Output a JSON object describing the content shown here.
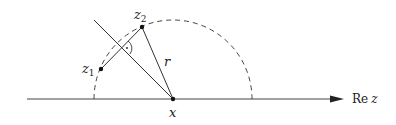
{
  "diagram": {
    "labels": {
      "z1": "z",
      "z1_sub": "1",
      "z2": "z",
      "z2_sub": "2",
      "r": "r",
      "x": "x",
      "axis_re": "Re",
      "axis_z": "z"
    },
    "points": {
      "x": [
        173,
        99
      ],
      "z1": [
        101,
        69
      ],
      "z2": [
        142,
        27
      ]
    },
    "circle": {
      "center": [
        173,
        99
      ],
      "radius": 79,
      "style": "dashed",
      "half": "upper"
    },
    "axis": {
      "from": [
        27,
        99
      ],
      "to": [
        342,
        99
      ],
      "arrow": true
    },
    "colors": {
      "stroke": "#333333",
      "background": "#ffffff"
    }
  }
}
